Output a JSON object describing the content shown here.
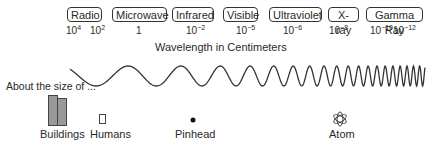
{
  "bands": [
    {
      "label": "Radio",
      "wavelengths": [
        {
          "base": "10",
          "exp": "4"
        },
        {
          "base": "10",
          "exp": "2"
        }
      ]
    },
    {
      "label": "Microwave",
      "wavelengths": [
        {
          "base": "1",
          "exp": ""
        }
      ]
    },
    {
      "label": "Infrared",
      "wavelengths": [
        {
          "base": "10",
          "exp": "−2"
        }
      ]
    },
    {
      "label": "Visible",
      "wavelengths": [
        {
          "base": "10",
          "exp": "−5"
        }
      ]
    },
    {
      "label": "Ultraviolet",
      "wavelengths": [
        {
          "base": "10",
          "exp": "−6"
        }
      ]
    },
    {
      "label": "X-ray",
      "wavelengths": [
        {
          "base": "10",
          "exp": "−8"
        }
      ]
    },
    {
      "label": "Gamma Ray",
      "wavelengths": [
        {
          "base": "10",
          "exp": "−10"
        },
        {
          "base": "10",
          "exp": "−12"
        }
      ]
    }
  ],
  "axis_label": "Wavelength in Centimeters",
  "size_caption": "About the size of ...",
  "size_examples": [
    {
      "label": "Buildings",
      "icon": "buildings-icon"
    },
    {
      "label": "Humans",
      "icon": "human-icon"
    },
    {
      "label": "Pinhead",
      "icon": "pinhead-icon"
    },
    {
      "label": "Atom",
      "icon": "atom-icon"
    }
  ],
  "colors": {
    "stroke": "#333333",
    "building_fill": "#999999"
  }
}
